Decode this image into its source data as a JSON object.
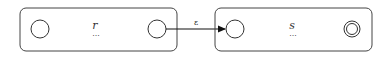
{
  "diagram": {
    "type": "nfa-concatenation",
    "machines": [
      {
        "id": "r",
        "label": "r",
        "ellipsis": "..."
      },
      {
        "id": "s",
        "label": "s",
        "ellipsis": "..."
      }
    ],
    "transition": {
      "label": "ε",
      "from": "r-final",
      "to": "s-start"
    },
    "colors": {
      "stroke": "#222222",
      "box": "#444444",
      "background": "#ffffff"
    }
  }
}
